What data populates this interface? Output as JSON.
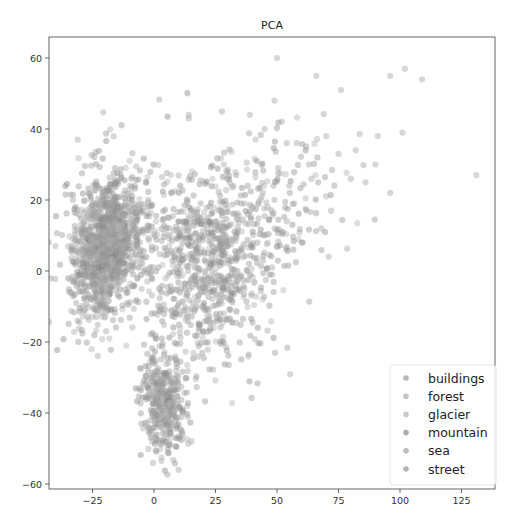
{
  "chart_data": {
    "type": "scatter",
    "title": "PCA",
    "xlabel": "",
    "ylabel": "",
    "xlim": [
      -38,
      143
    ],
    "ylim": [
      -62,
      66
    ],
    "xticks": [
      -25,
      0,
      25,
      50,
      75,
      100,
      125
    ],
    "yticks": [
      -60,
      -40,
      -20,
      0,
      20,
      40,
      60
    ],
    "grid": false,
    "legend_position": "lower right",
    "marker_color": "#8c8c8c",
    "marker_alpha": 0.45,
    "series": [
      {
        "name": "buildings",
        "color": "#9a9a9a"
      },
      {
        "name": "forest",
        "color": "#a8a8a8"
      },
      {
        "name": "glacier",
        "color": "#b4b4b4"
      },
      {
        "name": "mountain",
        "color": "#8a8a8a"
      },
      {
        "name": "sea",
        "color": "#a0a0a0"
      },
      {
        "name": "street",
        "color": "#969696"
      }
    ],
    "clusters": [
      {
        "label": "forest/street dense cluster",
        "cx": -20,
        "cy": 7,
        "sx": 6,
        "sy": 9,
        "n": 900,
        "rot": -0.35
      },
      {
        "label": "buildings/street halo",
        "cx": -18,
        "cy": 8,
        "sx": 9,
        "sy": 12,
        "n": 400,
        "rot": -0.3
      },
      {
        "label": "mountain/glacier center",
        "cx": 22,
        "cy": 2,
        "sx": 13,
        "sy": 14,
        "n": 750,
        "rot": 0.5
      },
      {
        "label": "glacier spread",
        "cx": 45,
        "cy": 18,
        "sx": 18,
        "sy": 12,
        "n": 160,
        "rot": 0.3
      },
      {
        "label": "sea lower cluster",
        "cx": 4,
        "cy": -37,
        "sx": 4.5,
        "sy": 7,
        "n": 380,
        "rot": 0.1
      }
    ],
    "outliers": [
      [
        50,
        60
      ],
      [
        66,
        55
      ],
      [
        76,
        51
      ],
      [
        96,
        55
      ],
      [
        102,
        57
      ],
      [
        109,
        54
      ],
      [
        49,
        48
      ],
      [
        131,
        27
      ],
      [
        101,
        39
      ],
      [
        91,
        38
      ],
      [
        75,
        33
      ],
      [
        82,
        34
      ],
      [
        70,
        38
      ],
      [
        64,
        26
      ],
      [
        70,
        21
      ],
      [
        72,
        17
      ],
      [
        62,
        17
      ],
      [
        57,
        19
      ],
      [
        54,
        14
      ],
      [
        49,
        12
      ],
      [
        45,
        10
      ],
      [
        48,
        1
      ],
      [
        48,
        -1
      ],
      [
        71,
        4
      ],
      [
        -31,
        37
      ],
      [
        10,
        -56
      ],
      [
        -35,
        -2
      ],
      [
        -33,
        20
      ],
      [
        39,
        44
      ],
      [
        45,
        40
      ],
      [
        58,
        36
      ],
      [
        86,
        25
      ],
      [
        90,
        30
      ],
      [
        96,
        22
      ],
      [
        80,
        26
      ],
      [
        68,
        12
      ],
      [
        60,
        8
      ],
      [
        55,
        24
      ],
      [
        63,
        30
      ],
      [
        54,
        36
      ]
    ]
  },
  "legend": {
    "items": [
      "buildings",
      "forest",
      "glacier",
      "mountain",
      "sea",
      "street"
    ]
  }
}
